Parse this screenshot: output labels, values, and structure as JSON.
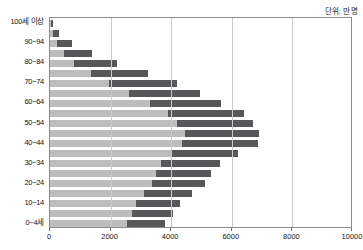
{
  "caption": {
    "unit_text": "단위: 만 명"
  },
  "legend": {
    "position": "top-right",
    "items": [
      {
        "label": "남",
        "color": "#bdbdbd",
        "swatch_name": "male-swatch"
      },
      {
        "label": "여",
        "color": "#555759",
        "swatch_name": "female-swatch"
      }
    ]
  },
  "axes": {
    "x": {
      "ticks": [
        "0",
        "2000",
        "4000",
        "6000",
        "8000",
        "10000"
      ],
      "min": 0,
      "max": 10000,
      "label": ""
    },
    "y": {
      "visible_ticks": [
        "100세 이상",
        "90~94",
        "80~84",
        "70~74",
        "60~64",
        "50~54",
        "40~44",
        "30~34",
        "20~24",
        "10~14",
        "0~4세"
      ],
      "label": ""
    }
  },
  "chart_data": {
    "type": "bar",
    "orientation": "horizontal",
    "stacked": true,
    "title": "",
    "subtitle": "",
    "xlabel": "",
    "ylabel": "",
    "unit": "단위: 만 명",
    "xlim": [
      0,
      10000
    ],
    "grid": true,
    "legend_position": "top-right",
    "categories": [
      "100세 이상",
      "95~99",
      "90~94",
      "85~89",
      "80~84",
      "75~79",
      "70~74",
      "65~69",
      "60~64",
      "55~59",
      "50~54",
      "45~49",
      "40~44",
      "35~39",
      "30~34",
      "25~29",
      "20~24",
      "15~19",
      "10~14",
      "5~9",
      "0~4세"
    ],
    "series": [
      {
        "name": "남",
        "color": "#bdbdbd",
        "values": [
          30,
          100,
          230,
          450,
          800,
          1350,
          1950,
          2600,
          3300,
          3900,
          4200,
          4450,
          4350,
          4000,
          3650,
          3500,
          3350,
          3100,
          2850,
          2700,
          2550
        ]
      },
      {
        "name": "여",
        "color": "#555759",
        "values": [
          70,
          190,
          490,
          950,
          1400,
          1900,
          2250,
          2350,
          2350,
          2500,
          2500,
          2450,
          2500,
          2200,
          1950,
          1800,
          1750,
          1600,
          1450,
          1350,
          1250
        ]
      }
    ],
    "totals": [
      100,
      290,
      720,
      1400,
      2200,
      3250,
      4200,
      4950,
      5650,
      6400,
      6700,
      6900,
      6850,
      6200,
      5600,
      5300,
      5100,
      4700,
      4300,
      4050,
      3800
    ]
  }
}
